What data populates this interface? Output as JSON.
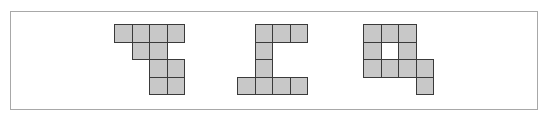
{
  "figure": {
    "cell_size": 17.5,
    "fill_color": "#c8c8c8",
    "stroke_color": "#3a3a3a",
    "frame_color": "#a8a8a8",
    "shapes": [
      {
        "id": "shape-1",
        "origin": [
          114,
          24
        ],
        "cells": [
          [
            0,
            0
          ],
          [
            0,
            1
          ],
          [
            0,
            2
          ],
          [
            0,
            3
          ],
          [
            1,
            1
          ],
          [
            1,
            2
          ],
          [
            2,
            2
          ],
          [
            2,
            3
          ],
          [
            3,
            2
          ],
          [
            3,
            3
          ]
        ]
      },
      {
        "id": "shape-2",
        "origin": [
          237,
          24
        ],
        "cells": [
          [
            0,
            1
          ],
          [
            0,
            2
          ],
          [
            0,
            3
          ],
          [
            1,
            1
          ],
          [
            2,
            1
          ],
          [
            3,
            0
          ],
          [
            3,
            1
          ],
          [
            3,
            2
          ],
          [
            3,
            3
          ]
        ]
      },
      {
        "id": "shape-3",
        "origin": [
          363,
          24
        ],
        "cells": [
          [
            0,
            0
          ],
          [
            0,
            1
          ],
          [
            0,
            2
          ],
          [
            1,
            0
          ],
          [
            1,
            2
          ],
          [
            2,
            0
          ],
          [
            2,
            1
          ],
          [
            2,
            2
          ],
          [
            2,
            3
          ],
          [
            3,
            3
          ]
        ]
      }
    ]
  }
}
